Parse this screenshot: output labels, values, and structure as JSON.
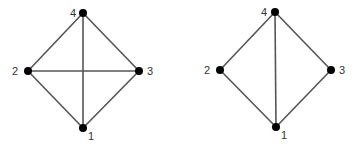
{
  "diagram": {
    "colors": {
      "background": "#ffffff",
      "edge": "#555555",
      "node": "#000000",
      "label": "#333333"
    },
    "graphs": [
      {
        "name": "complete-graph-k4",
        "nodes": [
          {
            "id": "1",
            "label": "1",
            "x": 83,
            "y": 128,
            "lx": 88,
            "ly": 140
          },
          {
            "id": "2",
            "label": "2",
            "x": 28,
            "y": 71,
            "lx": 12,
            "ly": 75
          },
          {
            "id": "3",
            "label": "3",
            "x": 139,
            "y": 71,
            "lx": 147,
            "ly": 75
          },
          {
            "id": "4",
            "label": "4",
            "x": 83,
            "y": 13,
            "lx": 70,
            "ly": 17
          }
        ],
        "edges": [
          [
            "4",
            "2"
          ],
          [
            "4",
            "3"
          ],
          [
            "4",
            "1"
          ],
          [
            "2",
            "1"
          ],
          [
            "3",
            "1"
          ],
          [
            "2",
            "3"
          ]
        ]
      },
      {
        "name": "graph-k4-minus-edge",
        "nodes": [
          {
            "id": "1",
            "label": "1",
            "x": 276,
            "y": 127,
            "lx": 281,
            "ly": 139
          },
          {
            "id": "2",
            "label": "2",
            "x": 220,
            "y": 70,
            "lx": 204,
            "ly": 74
          },
          {
            "id": "3",
            "label": "3",
            "x": 331,
            "y": 70,
            "lx": 339,
            "ly": 74
          },
          {
            "id": "4",
            "label": "4",
            "x": 275,
            "y": 12,
            "lx": 261,
            "ly": 16
          }
        ],
        "edges": [
          [
            "4",
            "2"
          ],
          [
            "4",
            "3"
          ],
          [
            "4",
            "1"
          ],
          [
            "2",
            "1"
          ],
          [
            "3",
            "1"
          ]
        ]
      }
    ]
  }
}
